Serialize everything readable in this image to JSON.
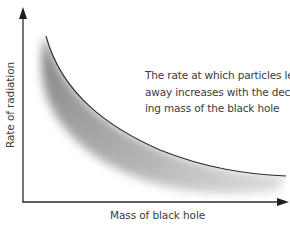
{
  "diagram": {
    "type": "conceptual-curve",
    "x_axis": {
      "label": "Mass of black hole",
      "direction": "increasing to the right"
    },
    "y_axis": {
      "label": "Rate of radiation",
      "direction": "increasing upward"
    },
    "curve": {
      "shape": "decreasing hyperbolic",
      "shading": "grey gradient below curve",
      "color": "#2a2a2a",
      "shade_color": "#8a8a8a"
    },
    "annotation": {
      "lines": [
        "The rate at which particles leak",
        "away increases with the decreas-",
        "ing mass of the black hole"
      ]
    },
    "colors": {
      "axis": "#2b2b2b",
      "text": "#3c3c3c",
      "background": "#ffffff"
    }
  }
}
